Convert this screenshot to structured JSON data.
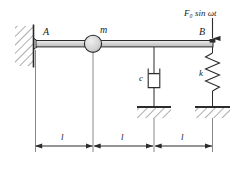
{
  "figure": {
    "type": "mechanical-vibration-schematic",
    "colors": {
      "line": "#2b2b2b",
      "beam_fill": "#d9d9d9",
      "mass_fill": "#d0d0d0",
      "hatch": "#4a4a4a",
      "background": "#ffffff"
    }
  },
  "labels": {
    "support_a": "A",
    "mass": "m",
    "point_b": "B",
    "force": "F₀ sin ωt",
    "force_amplitude": "F₀",
    "damper": "c",
    "spring": "k"
  },
  "dimensions": {
    "segments": [
      {
        "label": "l",
        "from": "A",
        "to": "m"
      },
      {
        "label": "l",
        "from": "m",
        "to": "c"
      },
      {
        "label": "l",
        "from": "c",
        "to": "B"
      }
    ],
    "total_label": "3l"
  },
  "elements": {
    "wall_support": "fixed-wall-hinge",
    "beam": "rigid-horizontal-bar",
    "mass_symbol": "circle",
    "damper_symbol": "dashpot",
    "spring_symbol": "zigzag-coil",
    "ground_symbol": "hatched-ground",
    "force_arrow": "downward-arrow"
  }
}
